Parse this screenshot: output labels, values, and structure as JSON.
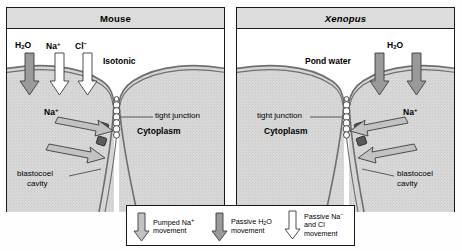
{
  "figure": {
    "type": "biology-diagram"
  },
  "panels": [
    {
      "id": "mouse",
      "title": "Mouse",
      "title_italic": false,
      "exterior_label": "Isotonic",
      "interior_label": "Cytoplasm",
      "junction_label": "tight junction",
      "cavity_label_line1": "blastocoel",
      "cavity_label_line2": "cavity",
      "apical_species": [
        {
          "label_html": "H<sub>2</sub>O",
          "arrow_fill": "gray"
        },
        {
          "label_html": "Na<sup>+</sup>",
          "arrow_fill": "white"
        },
        {
          "label_html": "Cl<sup>−</sup>",
          "arrow_fill": "white"
        }
      ],
      "pump_label_html": "Na<sup>+</sup>",
      "pump_direction": "right"
    },
    {
      "id": "xenopus",
      "title": "Xenopus",
      "title_italic": true,
      "exterior_label": "Pond water",
      "interior_label": "Cytoplasm",
      "junction_label": "tight junction",
      "cavity_label_line1": "blastocoel",
      "cavity_label_line2": "cavity",
      "apical_species": [
        {
          "label_html": "H<sub>2</sub>O",
          "arrow_fill": "gray"
        },
        {
          "label_html": "",
          "arrow_fill": "gray"
        }
      ],
      "pump_label_html": "Na<sup>+</sup>",
      "pump_direction": "left"
    }
  ],
  "legend": {
    "items": [
      {
        "arrow_fill": "lightgray",
        "line1": "Pumped Na<sup>+</sup>",
        "line2": "movement"
      },
      {
        "arrow_fill": "gray",
        "line1": "Passive H<sub>2</sub>O",
        "line2": "movement"
      },
      {
        "arrow_fill": "white",
        "line1": "Passive Na<sup>−</sup>",
        "line2": "and Cl",
        "line3": "movement"
      }
    ]
  },
  "colors": {
    "outline": "#1a1a1a",
    "title_bar": "#dcdcdc",
    "cytoplasm": "#d6d6d6",
    "exterior": "#ffffff",
    "arrow_gray": "#9a9a9a",
    "arrow_lightgray": "#c2c2c2",
    "arrow_white": "#ffffff",
    "membrane": "#6e6e6e",
    "pump_block": "#5a5a5a"
  }
}
